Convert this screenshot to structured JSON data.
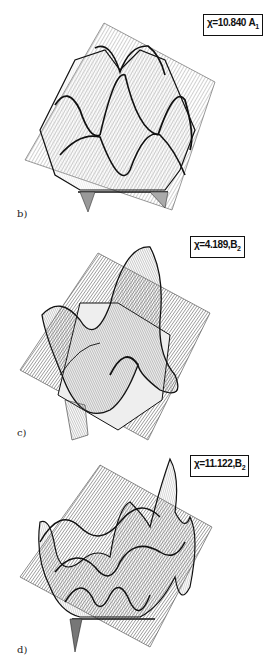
{
  "figure": {
    "panels": [
      {
        "id": "b",
        "letter": "b)",
        "label_symbol": "χ",
        "label_value": "=10.840",
        "label_symmetry": "A",
        "label_subscript": "1",
        "description": "3D surface plot over a tilted square plane showing a lattice of rounded peaks (symmetric A1 mode)"
      },
      {
        "id": "c",
        "letter": "c)",
        "label_symbol": "χ",
        "label_value": "=4.189,",
        "label_symmetry": "B",
        "label_subscript": "2",
        "description": "3D surface plot over a tilted square plane showing a saddle-like twisted surface (B2 mode)"
      },
      {
        "id": "d",
        "letter": "d)",
        "label_symbol": "χ",
        "label_value": "=11.122,",
        "label_symmetry": "B",
        "label_subscript": "2",
        "description": "3D surface plot over a tilted square plane showing many oscillating ridges and troughs (higher B2 mode)"
      }
    ]
  }
}
